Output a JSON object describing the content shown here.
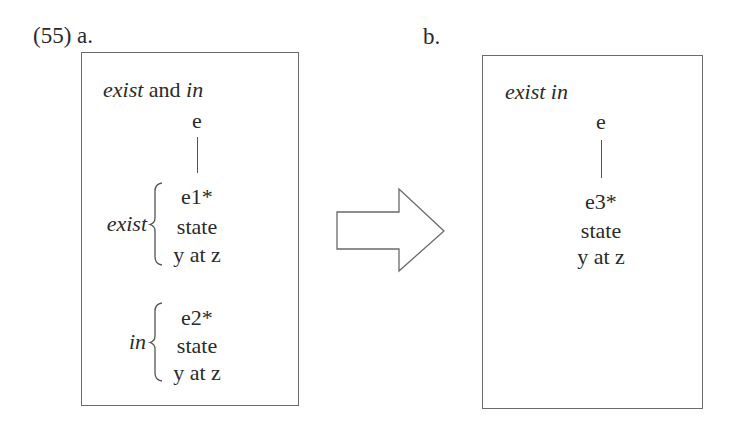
{
  "example": {
    "number": "(55)",
    "panel_a_label": "a.",
    "panel_b_label": "b."
  },
  "panel_a": {
    "title_parts": [
      {
        "text": "exist",
        "italic": true
      },
      {
        "text": " and ",
        "italic": false
      },
      {
        "text": "in",
        "italic": true
      }
    ],
    "root": "e",
    "groups": [
      {
        "label": "exist",
        "nodes": [
          "e1*",
          "state",
          "y at z"
        ]
      },
      {
        "label": "in",
        "nodes": [
          "e2*",
          "state",
          "y at z"
        ]
      }
    ]
  },
  "arrow": {
    "direction": "right",
    "shape": "block-arrow-outline"
  },
  "panel_b": {
    "title": "exist in",
    "root": "e",
    "nodes": [
      "e3*",
      "state",
      "y at z"
    ]
  },
  "colors": {
    "text": "#2a2a2a",
    "border": "#6a6a6a",
    "background": "#ffffff"
  }
}
